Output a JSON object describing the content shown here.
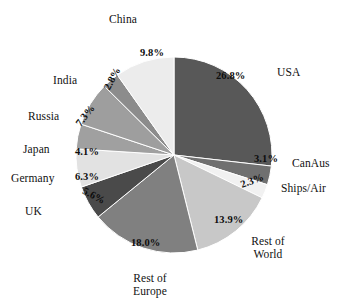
{
  "chart_data": {
    "type": "pie",
    "title": "",
    "subtitle": "",
    "xlabel": "",
    "ylabel": "",
    "legend_position": "outside-labels",
    "grid": false,
    "start_angle_deg": 0,
    "direction": "clockwise",
    "unit": "%",
    "categories": [
      "USA",
      "CanAus",
      "Ships/Air",
      "Rest of World",
      "Rest of Europe",
      "UK",
      "Germany",
      "Japan",
      "Russia",
      "India",
      "China"
    ],
    "values": [
      26.8,
      3.1,
      2.3,
      13.9,
      18.0,
      5.6,
      6.3,
      4.1,
      7.3,
      2.8,
      9.8
    ],
    "value_labels": [
      "26.8%",
      "3.1%",
      "2.3%",
      "13.9%",
      "18.0%",
      "5.6%",
      "6.3%",
      "4.1%",
      "7.3%",
      "2.8%",
      "9.8%"
    ],
    "slice_colors": [
      "#585858",
      "#707070",
      "#f1f1f1",
      "#c8c8c8",
      "#808080",
      "#4a4a4a",
      "#e2e2e2",
      "#a0a0a0",
      "#9e9e9e",
      "#8c8c8c",
      "#ececec"
    ],
    "slices": [
      {
        "label": "USA",
        "value": 26.8,
        "value_label": "26.8%",
        "color": "#585858"
      },
      {
        "label": "CanAus",
        "value": 3.1,
        "value_label": "3.1%",
        "color": "#707070"
      },
      {
        "label": "Ships/Air",
        "value": 2.3,
        "value_label": "2.3%",
        "color": "#f1f1f1"
      },
      {
        "label": "Rest of World",
        "value": 13.9,
        "value_label": "13.9%",
        "color": "#c8c8c8"
      },
      {
        "label": "Rest of Europe",
        "value": 18.0,
        "value_label": "18.0%",
        "color": "#808080"
      },
      {
        "label": "UK",
        "value": 5.6,
        "value_label": "5.6%",
        "color": "#4a4a4a"
      },
      {
        "label": "Germany",
        "value": 6.3,
        "value_label": "6.3%",
        "color": "#e2e2e2"
      },
      {
        "label": "Japan",
        "value": 4.1,
        "value_label": "4.1%",
        "color": "#a0a0a0"
      },
      {
        "label": "Russia",
        "value": 7.3,
        "value_label": "7.3%",
        "color": "#9e9e9e"
      },
      {
        "label": "India",
        "value": 2.8,
        "value_label": "2.8%",
        "color": "#8c8c8c"
      },
      {
        "label": "China",
        "value": 9.8,
        "value_label": "9.8%",
        "color": "#ececec"
      }
    ]
  },
  "labels": {
    "usa": "USA",
    "canaus": "CanAus",
    "ships_air": "Ships/Air",
    "rest_of_world_line1": "Rest of",
    "rest_of_world_line2": "World",
    "rest_of_europe_line1": "Rest of",
    "rest_of_europe_line2": "Europe",
    "uk": "UK",
    "germany": "Germany",
    "japan": "Japan",
    "russia": "Russia",
    "india": "India",
    "china": "China"
  },
  "percents": {
    "usa": "26.8%",
    "canaus": "3.1%",
    "ships_air": "2.3%",
    "rest_of_world": "13.9%",
    "rest_of_europe": "18.0%",
    "uk": "5.6%",
    "germany": "6.3%",
    "japan": "4.1%",
    "russia": "7.3%",
    "india": "2.8%",
    "china": "9.8%"
  },
  "colors": {
    "background": "#ffffff",
    "text": "#111111",
    "outline": "#ffffff"
  }
}
